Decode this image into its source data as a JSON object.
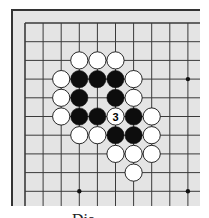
{
  "diagram": {
    "type": "go-board-fragment",
    "caption": "Dia",
    "board": {
      "background": "#e4e4e4",
      "border_color": "#333333",
      "line_color": "#3a3a3a",
      "left": 11,
      "top": 9,
      "right": 200,
      "bottom": 206,
      "grid_origin_x": 25,
      "grid_origin_y": 23,
      "col_spacing": 18.1,
      "row_spacing": 18.7,
      "cols": 10,
      "rows": 10,
      "stone_radius": 8.6
    },
    "star_points": [
      {
        "col": 9,
        "row": 3
      },
      {
        "col": 3,
        "row": 9
      },
      {
        "col": 9,
        "row": 9
      }
    ],
    "stones": [
      {
        "color": "white",
        "col": 3,
        "row": 2
      },
      {
        "color": "white",
        "col": 4,
        "row": 2
      },
      {
        "color": "white",
        "col": 5,
        "row": 2
      },
      {
        "color": "white",
        "col": 2,
        "row": 3
      },
      {
        "color": "black",
        "col": 3,
        "row": 3
      },
      {
        "color": "black",
        "col": 4,
        "row": 3
      },
      {
        "color": "black",
        "col": 5,
        "row": 3
      },
      {
        "color": "white",
        "col": 6,
        "row": 3
      },
      {
        "color": "white",
        "col": 2,
        "row": 4
      },
      {
        "color": "black",
        "col": 3,
        "row": 4
      },
      {
        "color": "black",
        "col": 5,
        "row": 4
      },
      {
        "color": "white",
        "col": 6,
        "row": 4
      },
      {
        "color": "white",
        "col": 2,
        "row": 5
      },
      {
        "color": "black",
        "col": 3,
        "row": 5
      },
      {
        "color": "black",
        "col": 4,
        "row": 5
      },
      {
        "color": "white",
        "col": 5,
        "row": 5,
        "label": "3"
      },
      {
        "color": "black",
        "col": 6,
        "row": 5
      },
      {
        "color": "white",
        "col": 7,
        "row": 5
      },
      {
        "color": "white",
        "col": 3,
        "row": 6
      },
      {
        "color": "white",
        "col": 4,
        "row": 6
      },
      {
        "color": "black",
        "col": 5,
        "row": 6
      },
      {
        "color": "black",
        "col": 6,
        "row": 6
      },
      {
        "color": "white",
        "col": 7,
        "row": 6
      },
      {
        "color": "white",
        "col": 5,
        "row": 7
      },
      {
        "color": "white",
        "col": 6,
        "row": 7
      },
      {
        "color": "white",
        "col": 7,
        "row": 7
      },
      {
        "color": "white",
        "col": 6,
        "row": 8
      }
    ]
  }
}
